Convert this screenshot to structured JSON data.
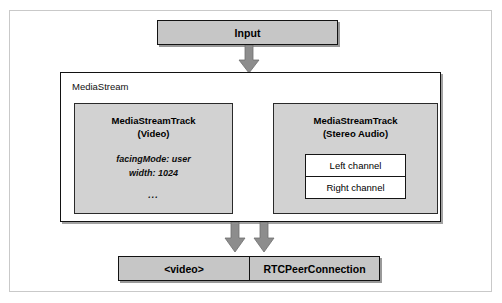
{
  "figure": {
    "colors": {
      "box_fill": "#c6c6c6",
      "track_fill": "#d2d2d2",
      "channel_fill": "#ffffff",
      "outline": "#121212",
      "arrow": "#808080",
      "frame": "#c9c9c9",
      "page_background": "#ffffff"
    }
  },
  "input": {
    "label": "Input"
  },
  "mediastream": {
    "label": "MediaStream",
    "tracks": [
      {
        "title_line1": "MediaStreamTrack",
        "title_line2": "(Video)",
        "properties": [
          "facingMode: user",
          "width: 1024"
        ],
        "ellipsis": "..."
      },
      {
        "title_line1": "MediaStreamTrack",
        "title_line2": "(Stereo Audio)",
        "channels": [
          "Left channel",
          "Right channel"
        ]
      }
    ]
  },
  "outputs": [
    {
      "label": "<video>"
    },
    {
      "label": "RTCPeerConnection"
    }
  ],
  "arrows": [
    {
      "name": "input-to-mediastream",
      "direction": "down"
    },
    {
      "name": "mediastream-to-video",
      "direction": "down"
    },
    {
      "name": "mediastream-to-rtcpeerconnection",
      "direction": "down"
    }
  ]
}
